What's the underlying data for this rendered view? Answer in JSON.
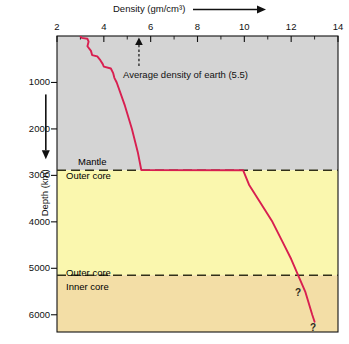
{
  "chart_data": {
    "type": "line",
    "title": "Density (gm/cm³)",
    "xlabel": "Density (gm/cm³)",
    "ylabel": "Depth (km)",
    "xlim": [
      2,
      14
    ],
    "ylim": [
      0,
      6371
    ],
    "y_inverted": true,
    "grid": false,
    "legend": null,
    "x_ticks": [
      "2",
      "4",
      "6",
      "8",
      "10",
      "12",
      "14"
    ],
    "x_tick_values": [
      2,
      4,
      6,
      8,
      10,
      12,
      14
    ],
    "y_ticks": [
      "1000",
      "2000",
      "3000",
      "4000",
      "5000",
      "6000"
    ],
    "y_tick_values": [
      1000,
      2000,
      3000,
      4000,
      5000,
      6000
    ],
    "series": [
      {
        "name": "Density profile",
        "color": "#D81F50",
        "points": [
          {
            "depth": 0,
            "density": 3.0
          },
          {
            "depth": 40,
            "density": 3.05
          },
          {
            "depth": 60,
            "density": 3.3
          },
          {
            "depth": 120,
            "density": 3.35
          },
          {
            "depth": 220,
            "density": 3.3
          },
          {
            "depth": 320,
            "density": 3.45
          },
          {
            "depth": 410,
            "density": 3.5
          },
          {
            "depth": 440,
            "density": 3.72
          },
          {
            "depth": 520,
            "density": 3.85
          },
          {
            "depth": 600,
            "density": 3.95
          },
          {
            "depth": 660,
            "density": 4.0
          },
          {
            "depth": 700,
            "density": 4.3
          },
          {
            "depth": 800,
            "density": 4.4
          },
          {
            "depth": 900,
            "density": 4.45
          },
          {
            "depth": 1000,
            "density": 4.55
          },
          {
            "depth": 1500,
            "density": 4.9
          },
          {
            "depth": 2000,
            "density": 5.2
          },
          {
            "depth": 2500,
            "density": 5.45
          },
          {
            "depth": 2885,
            "density": 5.6
          },
          {
            "depth": 2890,
            "density": 9.95
          },
          {
            "depth": 3200,
            "density": 10.2
          },
          {
            "depth": 3600,
            "density": 10.7
          },
          {
            "depth": 4000,
            "density": 11.2
          },
          {
            "depth": 4400,
            "density": 11.6
          },
          {
            "depth": 4800,
            "density": 12.0
          },
          {
            "depth": 5150,
            "density": 12.3
          },
          {
            "depth": 5500,
            "density": 12.6
          },
          {
            "depth": 6000,
            "density": 12.9
          },
          {
            "depth": 6150,
            "density": 13.0
          }
        ]
      }
    ],
    "regions": [
      {
        "name": "Mantle",
        "top_depth": 0,
        "bottom_depth": 2890,
        "color": "#D4D4D4"
      },
      {
        "name": "Outer core",
        "top_depth": 2890,
        "bottom_depth": 5150,
        "color": "#FAF7AE"
      },
      {
        "name": "Inner core",
        "top_depth": 5150,
        "bottom_depth": 6371,
        "color": "#F3DEA6"
      }
    ],
    "boundaries": [
      {
        "depth": 2890,
        "above_label": "Mantle",
        "below_label": "Outer core"
      },
      {
        "depth": 5150,
        "above_label": "Outer core",
        "below_label": "Inner core"
      }
    ],
    "annotations": [
      {
        "name": "average-density",
        "text": "Average density of earth (5.5)",
        "density": 5.5,
        "arrow": "up-dashed"
      },
      {
        "name": "question-mark-upper",
        "text": "?"
      },
      {
        "name": "question-mark-lower",
        "text": "?"
      }
    ]
  },
  "axes": {
    "x_title": "Density (gm/cm³)",
    "y_title": "Depth (km)",
    "x_labels": [
      "2",
      "4",
      "6",
      "8",
      "10",
      "12",
      "14"
    ],
    "y_labels": [
      "1000",
      "2000",
      "3000",
      "4000",
      "5000",
      "6000"
    ]
  },
  "layers": {
    "mantle": "Mantle",
    "outer_core_upper": "Outer core",
    "outer_core_lower": "Outer core",
    "inner_core": "Inner core"
  },
  "annotation": {
    "average_density": "Average density of earth (5.5)",
    "q_upper": "?",
    "q_lower": "?"
  },
  "colors": {
    "curve": "#D81F50",
    "mantle_fill": "#D4D4D4",
    "outer_core_fill": "#FAF7AE",
    "inner_core_fill": "#F3DEA6",
    "axis": "#111111"
  }
}
